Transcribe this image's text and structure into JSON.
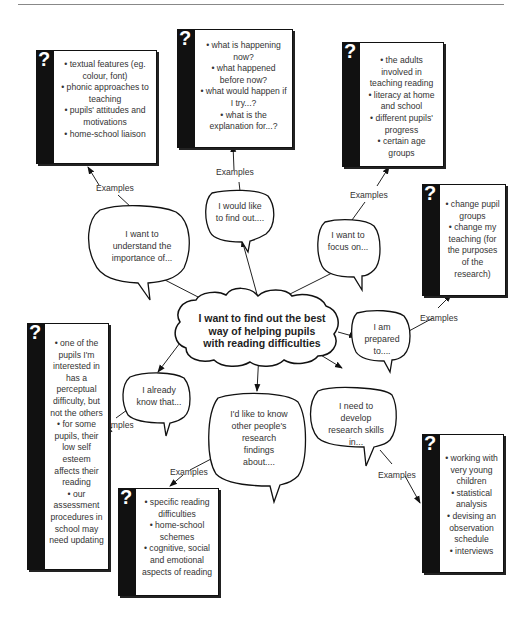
{
  "center": {
    "text": "I want to find out the best way of helping pupils with reading difficulties"
  },
  "examples_label": "Examples",
  "branches": [
    {
      "id": "understand",
      "bubble": "I want to understand the importance of...",
      "examples": [
        "textual features (eg. colour, font)",
        "phonic approaches to teaching",
        "pupils' attitudes and motivations",
        "home-school liaison"
      ]
    },
    {
      "id": "find-out",
      "bubble": "I would like to find out....",
      "examples": [
        "what is happening now?",
        "what happened before now?",
        "what would happen if I try...?",
        "what is the explanation for...?"
      ]
    },
    {
      "id": "focus",
      "bubble": "I want to focus on...",
      "examples": [
        "the adults involved in teaching reading",
        "literacy at home and school",
        "different pupils' progress",
        "certain age groups"
      ]
    },
    {
      "id": "prepared",
      "bubble": "I am prepared to....",
      "examples": [
        "change pupil groups",
        "change my teaching (for the purposes of the research)"
      ]
    },
    {
      "id": "already-know",
      "bubble": "I already know that...",
      "examples": [
        "one of the pupils I'm interested in has a perceptual difficulty, but not the others",
        "for some pupils, their low self esteem affects their reading",
        "our assessment procedures in school may need updating"
      ]
    },
    {
      "id": "others-findings",
      "bubble": "I'd like to know other people's research findings about....",
      "examples": [
        "specific reading difficulties",
        "home-school schemes",
        "cognitive, social and emotional aspects of reading"
      ]
    },
    {
      "id": "research-skills",
      "bubble": "I need to develop research skills in...",
      "examples": [
        "working with very young children",
        "statistical analysis",
        "devising an observation schedule",
        "interviews"
      ]
    }
  ],
  "question_mark": "?"
}
